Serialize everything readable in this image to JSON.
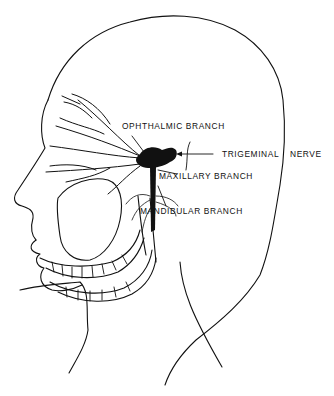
{
  "diagram": {
    "colors": {
      "ink": "#111111",
      "background": "#ffffff"
    },
    "labels": {
      "ophthalmic": "OPHTHALMIC BRANCH",
      "trigeminal": "TRIGEMINAL",
      "nerve": "NERVE",
      "maxillary": "MAXILLARY BRANCH",
      "mandibular": "MANDIBULAR BRANCH"
    }
  }
}
